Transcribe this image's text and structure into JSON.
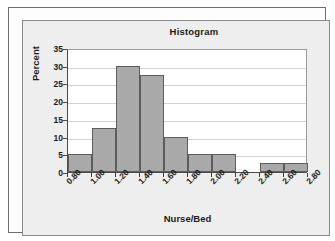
{
  "chart_data": {
    "type": "bar",
    "title": "Histogram",
    "xlabel": "Nurse/Bed",
    "ylabel": "Percent",
    "grid": true,
    "legend": null,
    "ylim": [
      0,
      35
    ],
    "xlim": [
      0.8,
      2.8
    ],
    "ytick_labels": [
      "35",
      "30",
      "25",
      "20",
      "15",
      "10",
      "5",
      "0"
    ],
    "ytick_values": [
      35,
      30,
      25,
      20,
      15,
      10,
      5,
      0
    ],
    "xtick_labels": [
      "0.80",
      "1.00",
      "1.20",
      "1.40",
      "1.60",
      "1.80",
      "2.00",
      "2.20",
      "2.40",
      "2.60",
      "2.80"
    ],
    "xtick_values": [
      0.8,
      1.0,
      1.2,
      1.4,
      1.6,
      1.8,
      2.0,
      2.2,
      2.4,
      2.6,
      2.8
    ],
    "bin_width": 0.2,
    "bin_edges": [
      0.8,
      1.0,
      1.2,
      1.4,
      1.6,
      1.8,
      2.0,
      2.2,
      2.4,
      2.6,
      2.8
    ],
    "categories": [
      "0.80-1.00",
      "1.00-1.20",
      "1.20-1.40",
      "1.40-1.60",
      "1.60-1.80",
      "1.80-2.00",
      "2.00-2.20",
      "2.20-2.40",
      "2.40-2.60",
      "2.60-2.80"
    ],
    "values": [
      5,
      12.5,
      30,
      27.5,
      10,
      5,
      5,
      0,
      2.5,
      2.5
    ],
    "bar_fill_color": "#a9a9a9",
    "bar_edge_color": "#5d5d5d",
    "panel_color": "#eeeeee",
    "plot_background": "#ffffff",
    "gridline_color": "#d2d2d2",
    "axis_color": "#4a4a4a",
    "text_color": "#1b1b1b"
  }
}
